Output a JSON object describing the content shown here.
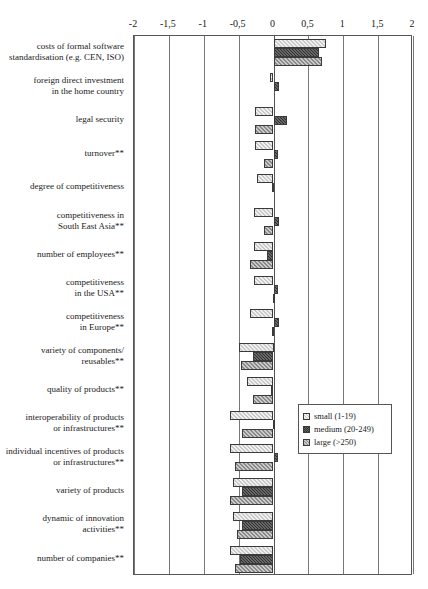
{
  "chart_data": {
    "type": "bar",
    "orientation": "horizontal",
    "title": "",
    "subtitle": "",
    "xlabel": "",
    "ylabel": "",
    "xlim": [
      -2,
      2
    ],
    "grid": true,
    "legend_position": "inside-right",
    "tick_labels": [
      "-2",
      "-1,5",
      "-1",
      "-0,5",
      "0",
      "0,5",
      "1",
      "1,5",
      "2"
    ],
    "tick_values": [
      -2,
      -1.5,
      -1,
      -0.5,
      0,
      0.5,
      1,
      1.5,
      2
    ],
    "categories": [
      "costs of formal software standardisation (e.g. CEN, ISO)",
      "foreign direct investment in the home country",
      "legal security",
      "turnover**",
      "degree of competitiveness",
      "competitiveness in South East Asia**",
      "number of employees**",
      "competitiveness in the USA**",
      "competitiveness in Europe**",
      "variety of components/ reusables**",
      "quality of products**",
      "interoperability of products or infrastructures**",
      "individual incentives of products or infrastructures**",
      "variety of products",
      "dynamic of innovation activities**",
      "number of companies**"
    ],
    "category_lines": [
      [
        "costs of formal software",
        "standardisation (e.g. CEN, ISO)"
      ],
      [
        "foreign direct investment",
        "in the home country"
      ],
      [
        "legal security"
      ],
      [
        "turnover**"
      ],
      [
        "degree of competitiveness"
      ],
      [
        "competitiveness in",
        "South East Asia**"
      ],
      [
        "number of employees**"
      ],
      [
        "competitiveness",
        "in the USA**"
      ],
      [
        "competitiveness",
        "in Europe**"
      ],
      [
        "variety of components/",
        "reusables**"
      ],
      [
        "quality of products**"
      ],
      [
        "interoperability of products",
        "or infrastructures**"
      ],
      [
        "individual incentives of products",
        "or infrastructures**"
      ],
      [
        "variety of products"
      ],
      [
        "dynamic of innovation",
        "activities**"
      ],
      [
        "number of companies**"
      ]
    ],
    "series": [
      {
        "name": "small (1-19)",
        "key": "small",
        "values": [
          0.75,
          -0.05,
          -0.27,
          -0.26,
          -0.24,
          -0.28,
          -0.28,
          -0.28,
          -0.33,
          -0.5,
          -0.38,
          -0.62,
          -0.62,
          -0.58,
          -0.58,
          -0.62
        ]
      },
      {
        "name": "medium (20-249)",
        "key": "medium",
        "values": [
          0.65,
          0.08,
          0.2,
          0.07,
          -0.02,
          0.08,
          -0.1,
          0.07,
          0.08,
          -0.3,
          -0.03,
          -0.01,
          0.07,
          -0.45,
          -0.45,
          -0.48
        ]
      },
      {
        "name": "large (>250)",
        "key": "large",
        "values": [
          0.7,
          0.0,
          -0.27,
          -0.13,
          0.0,
          -0.14,
          -0.33,
          -0.01,
          -0.02,
          -0.47,
          -0.3,
          -0.45,
          -0.55,
          -0.62,
          -0.52,
          -0.55
        ]
      }
    ],
    "legend": [
      {
        "label": "small (1-19)",
        "key": "small",
        "color": "#c9c9c9"
      },
      {
        "label": "medium (20-249)",
        "key": "medium",
        "color": "#2e2e2e"
      },
      {
        "label": "large (>250)",
        "key": "large",
        "color": "#8a8a8a"
      }
    ]
  }
}
